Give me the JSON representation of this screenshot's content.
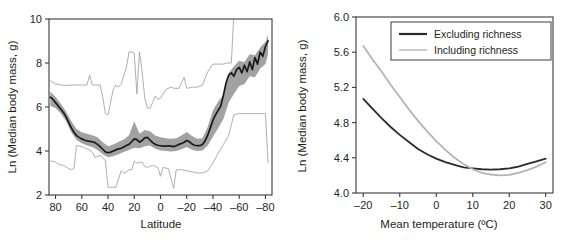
{
  "figure": {
    "panel_count": 2
  },
  "chart_data": [
    {
      "id": "latitude-panel",
      "type": "line",
      "title": "",
      "xlabel": "Latitude",
      "ylabel": "Ln (Median body mass, g)",
      "xlim": [
        85,
        -85
      ],
      "ylim": [
        2,
        10
      ],
      "xticks": [
        80,
        60,
        40,
        20,
        0,
        -20,
        -40,
        -60,
        -80
      ],
      "xtick_labels": [
        "80",
        "60",
        "40",
        "20",
        "0",
        "–20",
        "–40",
        "–60",
        "–80"
      ],
      "yticks": [
        2,
        4,
        6,
        8,
        10
      ],
      "ytick_labels": [
        "2",
        "4",
        "6",
        "8",
        "10"
      ],
      "grid": false,
      "legend": "none",
      "series": [
        {
          "name": "Median (running)",
          "style": "dark-line",
          "x": [
            84,
            82,
            80,
            78,
            76,
            74,
            72,
            70,
            68,
            66,
            64,
            62,
            60,
            58,
            56,
            54,
            52,
            50,
            48,
            46,
            44,
            42,
            40,
            38,
            36,
            34,
            32,
            30,
            28,
            26,
            24,
            22,
            20,
            18,
            16,
            14,
            12,
            10,
            8,
            6,
            4,
            2,
            0,
            -2,
            -4,
            -6,
            -8,
            -10,
            -12,
            -14,
            -16,
            -18,
            -20,
            -22,
            -24,
            -26,
            -28,
            -30,
            -32,
            -34,
            -36,
            -38,
            -40,
            -42,
            -44,
            -46,
            -48,
            -50,
            -52,
            -54,
            -56,
            -58,
            -60,
            -62,
            -64,
            -66,
            -68,
            -70,
            -72,
            -74,
            -76,
            -78,
            -80,
            -82
          ],
          "values": [
            6.45,
            6.35,
            6.2,
            6.05,
            5.9,
            5.75,
            5.55,
            5.3,
            5.05,
            4.85,
            4.7,
            4.62,
            4.55,
            4.5,
            4.46,
            4.44,
            4.42,
            4.38,
            4.3,
            4.2,
            4.08,
            3.96,
            3.92,
            3.95,
            4.0,
            4.05,
            4.1,
            4.12,
            4.18,
            4.25,
            4.3,
            4.42,
            4.55,
            4.52,
            4.4,
            4.48,
            4.6,
            4.62,
            4.5,
            4.38,
            4.3,
            4.26,
            4.24,
            4.22,
            4.22,
            4.24,
            4.22,
            4.2,
            4.24,
            4.3,
            4.34,
            4.4,
            4.48,
            4.42,
            4.32,
            4.26,
            4.24,
            4.24,
            4.3,
            4.46,
            4.72,
            5.05,
            5.4,
            5.65,
            5.85,
            6.05,
            6.55,
            7.1,
            7.45,
            7.55,
            7.4,
            7.7,
            7.8,
            7.55,
            7.9,
            7.6,
            8.05,
            7.7,
            8.25,
            7.95,
            8.5,
            8.3,
            8.75,
            9.0
          ]
        },
        {
          "name": "Interquartile band upper",
          "style": "gray-band-edge",
          "x": [
            84,
            80,
            76,
            72,
            68,
            64,
            60,
            56,
            52,
            48,
            44,
            40,
            36,
            32,
            28,
            24,
            20,
            16,
            12,
            8,
            4,
            0,
            -4,
            -8,
            -12,
            -16,
            -20,
            -24,
            -28,
            -32,
            -36,
            -40,
            -44,
            -48,
            -52,
            -56,
            -60,
            -64,
            -68,
            -72,
            -76,
            -80,
            -82
          ],
          "values": [
            6.7,
            6.45,
            6.15,
            5.8,
            5.35,
            5.0,
            4.85,
            4.78,
            4.72,
            4.62,
            4.4,
            4.22,
            4.3,
            4.42,
            4.52,
            4.72,
            5.35,
            4.78,
            4.95,
            4.9,
            4.7,
            4.62,
            4.58,
            4.56,
            4.58,
            4.7,
            4.86,
            4.68,
            4.56,
            4.58,
            5.1,
            5.85,
            6.25,
            6.55,
            7.55,
            7.85,
            8.1,
            8.05,
            8.4,
            8.35,
            8.7,
            8.95,
            9.3
          ]
        },
        {
          "name": "Interquartile band lower",
          "style": "gray-band-edge",
          "x": [
            84,
            80,
            76,
            72,
            68,
            64,
            60,
            56,
            52,
            48,
            44,
            40,
            36,
            32,
            28,
            24,
            20,
            16,
            12,
            8,
            4,
            0,
            -4,
            -8,
            -12,
            -16,
            -20,
            -24,
            -28,
            -32,
            -36,
            -40,
            -44,
            -48,
            -52,
            -56,
            -60,
            -64,
            -68,
            -72,
            -76,
            -80,
            -82
          ],
          "values": [
            6.05,
            5.95,
            5.7,
            5.35,
            4.85,
            4.5,
            4.35,
            4.25,
            4.18,
            4.05,
            3.85,
            3.72,
            3.76,
            3.85,
            3.95,
            4.05,
            4.15,
            4.12,
            4.22,
            4.25,
            4.1,
            4.02,
            4.0,
            3.98,
            4.0,
            4.08,
            4.18,
            4.06,
            4.0,
            4.02,
            4.25,
            4.65,
            5.05,
            5.45,
            6.2,
            6.6,
            6.95,
            7.05,
            7.4,
            7.35,
            7.75,
            7.95,
            8.4
          ]
        },
        {
          "name": "Upper envelope (maximum)",
          "style": "thin-gray-line",
          "x": [
            84,
            80,
            76,
            72,
            68,
            64,
            60,
            56,
            54,
            52,
            50,
            46,
            44,
            42,
            40,
            36,
            34,
            32,
            30,
            26,
            24,
            22,
            20,
            18,
            16,
            14,
            12,
            10,
            8,
            6,
            4,
            2,
            0,
            -4,
            -8,
            -10,
            -14,
            -18,
            -20,
            -24,
            -28,
            -32,
            -36,
            -40,
            -44,
            -48,
            -50,
            -54,
            -56,
            -58,
            -62,
            -66,
            -70,
            -74,
            -78,
            -82
          ],
          "values": [
            7.2,
            7.05,
            7.0,
            6.98,
            7.0,
            7.0,
            7.0,
            7.0,
            7.45,
            7.0,
            7.0,
            7.0,
            6.45,
            5.7,
            5.65,
            6.8,
            7.0,
            6.9,
            7.05,
            7.8,
            8.5,
            8.5,
            8.45,
            6.6,
            8.5,
            7.6,
            6.4,
            5.95,
            5.95,
            6.2,
            6.5,
            6.35,
            6.4,
            6.8,
            6.9,
            6.85,
            6.85,
            7.35,
            6.85,
            6.9,
            6.9,
            7.0,
            7.6,
            7.95,
            7.95,
            7.95,
            8.0,
            8.0,
            10.35,
            10.3,
            10.3,
            10.3,
            10.3,
            10.3,
            10.3,
            10.3
          ]
        },
        {
          "name": "Lower envelope (minimum)",
          "style": "thin-gray-line",
          "x": [
            84,
            80,
            78,
            74,
            70,
            68,
            66,
            64,
            60,
            56,
            52,
            50,
            46,
            44,
            42,
            40,
            38,
            36,
            34,
            30,
            28,
            26,
            24,
            22,
            20,
            18,
            14,
            12,
            10,
            8,
            6,
            4,
            2,
            0,
            -2,
            -6,
            -10,
            -12,
            -16,
            -20,
            -24,
            -28,
            -32,
            -36,
            -40,
            -44,
            -48,
            -52,
            -54,
            -56,
            -60,
            -64,
            -68,
            -72,
            -76,
            -80,
            -82
          ],
          "values": [
            3.55,
            3.5,
            3.4,
            3.35,
            3.2,
            3.15,
            3.2,
            4.25,
            4.2,
            4.1,
            3.95,
            3.7,
            3.8,
            3.7,
            3.55,
            2.35,
            2.35,
            2.35,
            2.35,
            3.1,
            3.0,
            3.05,
            3.15,
            3.15,
            3.55,
            3.45,
            3.5,
            3.3,
            3.25,
            3.3,
            3.35,
            3.3,
            3.25,
            2.85,
            3.25,
            3.2,
            2.3,
            3.15,
            3.15,
            3.1,
            3.05,
            3.0,
            3.0,
            3.1,
            3.45,
            3.9,
            4.3,
            4.7,
            5.2,
            5.65,
            5.7,
            5.7,
            5.7,
            5.7,
            5.7,
            5.7,
            3.45
          ]
        }
      ]
    },
    {
      "id": "temperature-panel",
      "type": "line",
      "title": "",
      "xlabel": "Mean temperature (ºC)",
      "ylabel": "Ln (Median body mass, g)",
      "xlim": [
        -22,
        32
      ],
      "ylim": [
        4.0,
        6.0
      ],
      "xticks": [
        -20,
        -10,
        0,
        10,
        20,
        30
      ],
      "xtick_labels": [
        "–20",
        "–10",
        "0",
        "10",
        "20",
        "30"
      ],
      "yticks": [
        4.0,
        4.4,
        4.8,
        5.2,
        5.6,
        6.0
      ],
      "ytick_labels": [
        "4.0",
        "4.4",
        "4.8",
        "5.2",
        "5.6",
        "6.0"
      ],
      "grid": false,
      "legend": "top-right",
      "series": [
        {
          "name": "Excluding richness",
          "style": "dark-line",
          "color": "#2b2b2b",
          "x": [
            -20,
            -17.5,
            -15,
            -12.5,
            -10,
            -7.5,
            -5,
            -2.5,
            0,
            2.5,
            5,
            7.5,
            10,
            12.5,
            15,
            17.5,
            20,
            22.5,
            25,
            27.5,
            30
          ],
          "values": [
            5.07,
            4.96,
            4.85,
            4.75,
            4.66,
            4.58,
            4.5,
            4.44,
            4.39,
            4.35,
            4.32,
            4.29,
            4.28,
            4.27,
            4.265,
            4.27,
            4.28,
            4.3,
            4.33,
            4.36,
            4.39
          ]
        },
        {
          "name": "Including richness",
          "style": "light-line",
          "color": "#b4b4b4",
          "x": [
            -20,
            -17.5,
            -15,
            -12.5,
            -10,
            -7.5,
            -5,
            -2.5,
            0,
            2.5,
            5,
            7.5,
            10,
            12.5,
            15,
            17.5,
            20,
            22.5,
            25,
            27.5,
            30
          ],
          "values": [
            5.67,
            5.52,
            5.38,
            5.23,
            5.09,
            4.95,
            4.82,
            4.7,
            4.59,
            4.49,
            4.4,
            4.33,
            4.27,
            4.23,
            4.21,
            4.2,
            4.205,
            4.23,
            4.26,
            4.3,
            4.35
          ]
        }
      ],
      "legend_entries": [
        {
          "label": "Excluding richness",
          "color": "#2b2b2b"
        },
        {
          "label": "Including richness",
          "color": "#b4b4b4"
        }
      ]
    }
  ]
}
